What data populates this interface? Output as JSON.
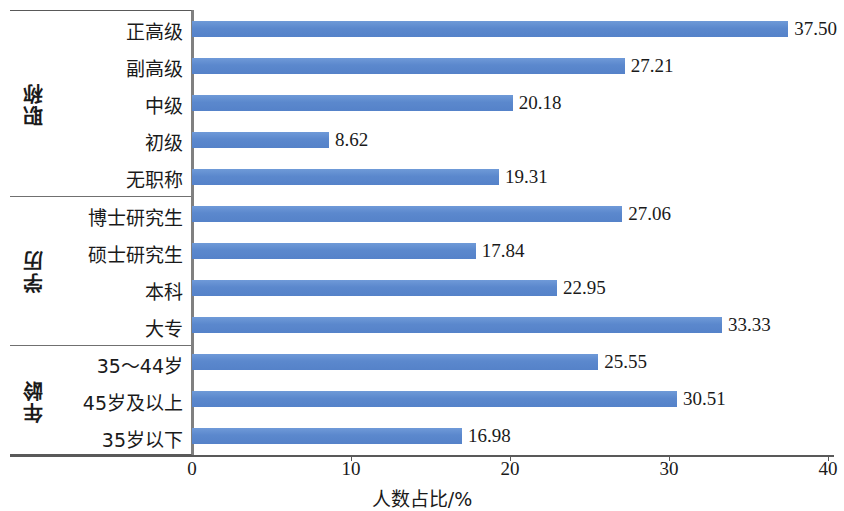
{
  "chart_data": {
    "type": "bar",
    "orientation": "horizontal",
    "title": "",
    "xlabel": "人数占比/%",
    "ylabel": "",
    "xlim": [
      0,
      40
    ],
    "xticks": [
      "0",
      "10",
      "20",
      "30",
      "40"
    ],
    "grid": false,
    "legend": null,
    "bar_color": "#5b88cd",
    "axis_color": "#595959",
    "value_format": "2 decimals",
    "groups": [
      {
        "name": "职称",
        "categories": [
          "正高级",
          "副高级",
          "中级",
          "初级",
          "无职称"
        ],
        "values": [
          37.5,
          27.21,
          20.18,
          8.62,
          19.31
        ],
        "labels": [
          "37.50",
          "27.21",
          "20.18",
          "8.62",
          "19.31"
        ]
      },
      {
        "name": "学历",
        "categories": [
          "博士研究生",
          "硕士研究生",
          "本科",
          "大专"
        ],
        "values": [
          27.06,
          17.84,
          22.95,
          33.33
        ],
        "labels": [
          "27.06",
          "17.84",
          "22.95",
          "33.33"
        ]
      },
      {
        "name": "年龄",
        "categories": [
          "35～44岁",
          "45岁及以上",
          "35岁以下"
        ],
        "values": [
          25.55,
          30.51,
          16.98
        ],
        "labels": [
          "25.55",
          "30.51",
          "16.98"
        ]
      }
    ],
    "categories_flat": [
      "正高级",
      "副高级",
      "中级",
      "初级",
      "无职称",
      "博士研究生",
      "硕士研究生",
      "本科",
      "大专",
      "35～44岁",
      "45岁及以上",
      "35岁以下"
    ],
    "values_flat": [
      37.5,
      27.21,
      20.18,
      8.62,
      19.31,
      27.06,
      17.84,
      22.95,
      33.33,
      25.55,
      30.51,
      16.98
    ]
  }
}
